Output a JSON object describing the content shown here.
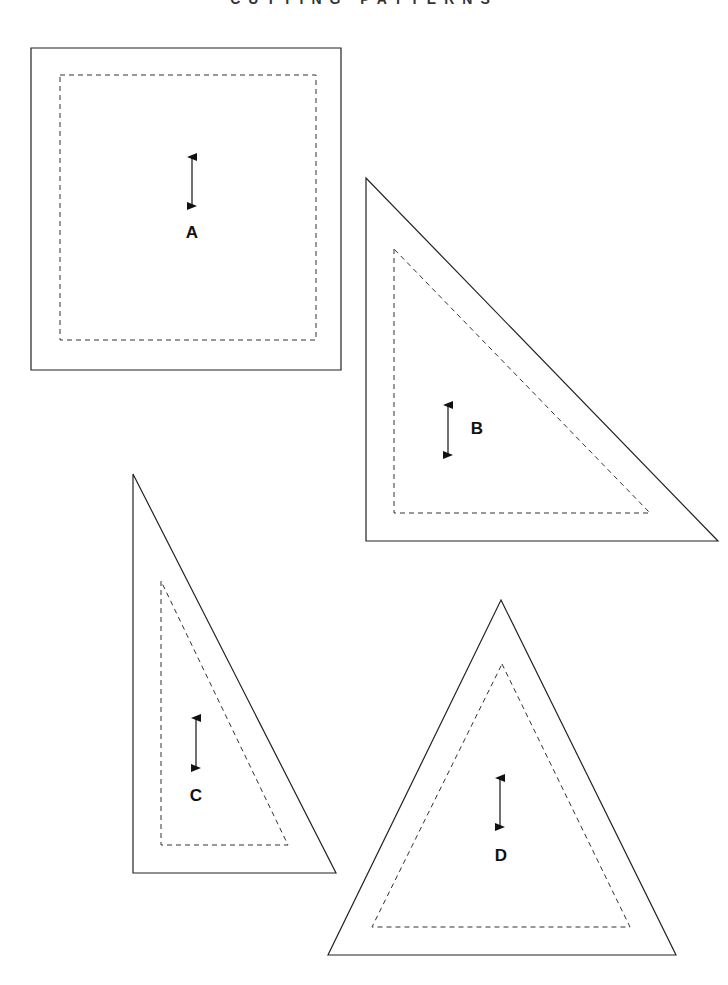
{
  "header": {
    "title": "CUTTING PATTERNS"
  },
  "colors": {
    "stroke": "#222222",
    "background": "#ffffff"
  },
  "templates": [
    {
      "label": "A",
      "shape": "square",
      "outer": [
        [
          31,
          48
        ],
        [
          341,
          48
        ],
        [
          341,
          370
        ],
        [
          31,
          370
        ]
      ],
      "seam": [
        [
          60,
          75
        ],
        [
          316,
          75
        ],
        [
          316,
          340
        ],
        [
          60,
          340
        ]
      ],
      "grain_arrow": {
        "x": 192,
        "y1": 152,
        "y2": 211
      },
      "label_pos": [
        192,
        238
      ]
    },
    {
      "label": "B",
      "shape": "right-triangle",
      "outer": [
        [
          366,
          178
        ],
        [
          366,
          541
        ],
        [
          718,
          541
        ]
      ],
      "seam": [
        [
          394,
          249
        ],
        [
          394,
          513
        ],
        [
          650,
          513
        ]
      ],
      "grain_arrow": {
        "x": 448,
        "y1": 400,
        "y2": 460
      },
      "label_pos": [
        477,
        434
      ]
    },
    {
      "label": "C",
      "shape": "right-triangle",
      "outer": [
        [
          133,
          474
        ],
        [
          133,
          873
        ],
        [
          336,
          873
        ]
      ],
      "seam": [
        [
          161,
          581
        ],
        [
          161,
          845
        ],
        [
          288,
          845
        ]
      ],
      "grain_arrow": {
        "x": 196,
        "y1": 713,
        "y2": 773
      },
      "label_pos": [
        196,
        801
      ]
    },
    {
      "label": "D",
      "shape": "isosceles-triangle",
      "outer": [
        [
          501,
          600
        ],
        [
          676,
          955
        ],
        [
          328,
          955
        ]
      ],
      "seam": [
        [
          502,
          664
        ],
        [
          630,
          927
        ],
        [
          372,
          927
        ]
      ],
      "grain_arrow": {
        "x": 500,
        "y1": 773,
        "y2": 832
      },
      "label_pos": [
        501,
        861
      ]
    }
  ]
}
